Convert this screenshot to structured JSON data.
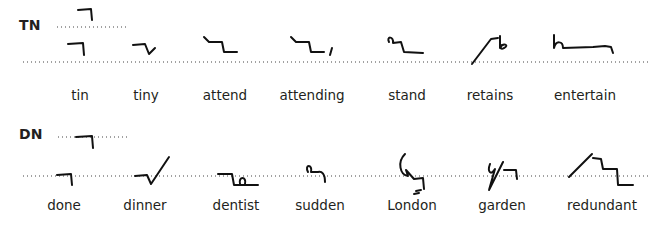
{
  "sections": [
    {
      "label": "TN",
      "words": [
        "tin",
        "tiny",
        "attend",
        "attending",
        "stand",
        "retains",
        "entertain"
      ]
    },
    {
      "label": "DN",
      "words": [
        "done",
        "dinner",
        "dentist",
        "sudden",
        "London",
        "garden",
        "redundant"
      ]
    }
  ],
  "colors": {
    "ink": "#111111",
    "text": "#231f20",
    "background": "#ffffff"
  }
}
